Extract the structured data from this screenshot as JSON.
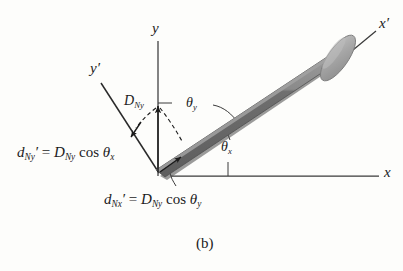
{
  "figure": {
    "caption": "(b)",
    "axes": [
      {
        "name": "x-axis",
        "label": "x",
        "prime": false
      },
      {
        "name": "y-axis",
        "label": "y",
        "prime": false
      },
      {
        "name": "x-prime-axis",
        "label": "x",
        "prime": true
      },
      {
        "name": "y-prime-axis",
        "label": "y",
        "prime": true
      }
    ],
    "angles": [
      {
        "name": "theta-x",
        "symbol": "θ",
        "sub": "x"
      },
      {
        "name": "theta-y",
        "symbol": "θ",
        "sub": "y"
      }
    ],
    "vectors": [
      {
        "name": "D-Ny-vector",
        "symbol": "D",
        "sub": "Ny"
      }
    ],
    "equations": [
      {
        "name": "d-Ny-prime-equation",
        "lhs_sym": "d",
        "lhs_sub": "Ny",
        "lhs_prime": "′",
        "eq": " = ",
        "rhs_sym": "D",
        "rhs_sub": "Ny",
        "fn": " cos ",
        "angle_sym": "θ",
        "angle_sub": "x"
      },
      {
        "name": "d-Nx-prime-equation",
        "lhs_sym": "d",
        "lhs_sub": "Nx",
        "lhs_prime": "′",
        "eq": " = ",
        "rhs_sym": "D",
        "rhs_sub": "Ny",
        "fn": " cos ",
        "angle_sym": "θ",
        "angle_sub": "y"
      }
    ],
    "colors": {
      "ink": "#1b1b1b",
      "background": "#fdfdfb",
      "bar_body": "#6b6b6b",
      "bar_highlight": "#9b9b9b",
      "bar_shadow": "#4a4a4a",
      "disk_face": "#a9a9a9",
      "disk_edge": "#7d7d7d",
      "axis_line": "#3a3a3a"
    }
  }
}
